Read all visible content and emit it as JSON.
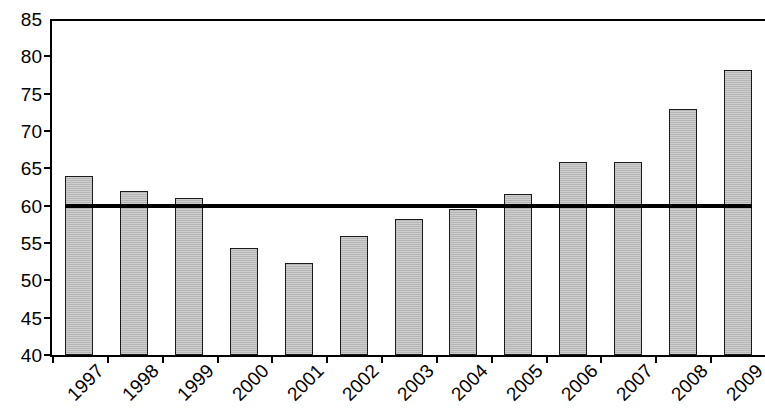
{
  "chart_data": {
    "type": "bar",
    "title": "",
    "subtitle": "",
    "xlabel": "",
    "ylabel": "",
    "categories": [
      "1997",
      "1998",
      "1999",
      "2000",
      "2001",
      "2002",
      "2003",
      "2004",
      "2005",
      "2006",
      "2007",
      "2008",
      "2009"
    ],
    "values": [
      64,
      62,
      61,
      54.3,
      52.3,
      56,
      58.2,
      59.5,
      61.6,
      65.8,
      65.8,
      73,
      78.2
    ],
    "series": [
      {
        "name": "value",
        "values": [
          64,
          62,
          61,
          54.3,
          52.3,
          56,
          58.2,
          59.5,
          61.6,
          65.8,
          65.8,
          73,
          78.2
        ]
      }
    ],
    "ylim": [
      40,
      85
    ],
    "ytick_step": 5,
    "ytick_labels": [
      "40",
      "45",
      "50",
      "55",
      "60",
      "65",
      "70",
      "75",
      "80",
      "85"
    ],
    "ytick_values": [
      40,
      45,
      50,
      55,
      60,
      65,
      70,
      75,
      80,
      85
    ],
    "grid": false,
    "legend": "none",
    "annotations": [
      {
        "type": "reference-line",
        "orientation": "horizontal",
        "value": 60,
        "label": "",
        "color": "#000000"
      }
    ],
    "colors": {
      "bar_fill": "#b9b9b9",
      "bar_border": "#1a1a1a",
      "axis": "#000000",
      "reference_line": "#000000",
      "background": "#ffffff"
    }
  }
}
